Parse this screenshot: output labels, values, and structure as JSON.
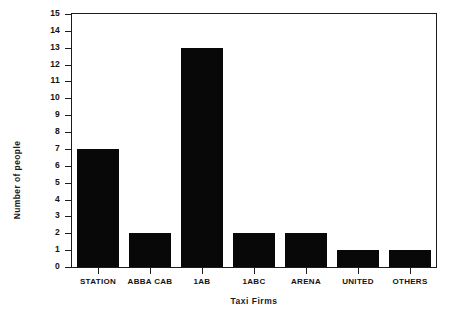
{
  "chart_data": {
    "type": "bar",
    "title": "",
    "xlabel": "Taxi Firms",
    "ylabel": "Number of people",
    "categories": [
      "STATION",
      "ABBA CAB",
      "1AB",
      "1ABC",
      "ARENA",
      "UNITED",
      "OTHERS"
    ],
    "values": [
      7,
      2,
      13,
      2,
      2,
      1,
      1
    ],
    "ylim": [
      0,
      15
    ],
    "yticks": [
      0,
      1,
      2,
      3,
      4,
      5,
      6,
      7,
      8,
      9,
      10,
      11,
      12,
      13,
      14,
      15
    ],
    "ytick_labels": [
      "0",
      "1",
      "2",
      "3",
      "4",
      "5",
      "6",
      "7",
      "8",
      "9",
      "10",
      "11",
      "12",
      "13",
      "14",
      "15"
    ],
    "grid": false,
    "legend": null,
    "legend_position": "none",
    "bar_color": "#080808",
    "axis_color": "#1c1c1c",
    "background_color": "#ffffff"
  }
}
